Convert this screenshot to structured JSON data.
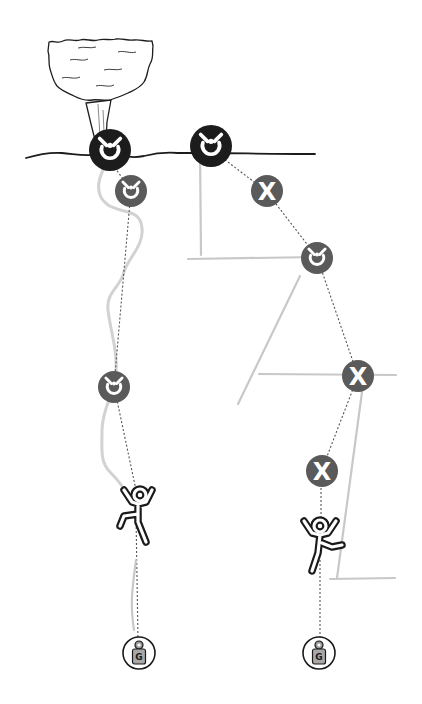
{
  "diagram": {
    "type": "climbing-anchor-fall-comparison",
    "colors": {
      "background": "#ffffff",
      "main_anchor_fill": "#1c1c1c",
      "protection_fill": "#5a5a5a",
      "sling": "#c8c8c8",
      "rope": "#d2d2d2",
      "ground_line": "#1c1c1c",
      "climber_outline": "#1a1a1a"
    },
    "left_system": {
      "anchor": {
        "icon": "ring-bolt-icon",
        "style": "main"
      },
      "protections": [
        {
          "icon": "ring-bolt-icon",
          "label": ""
        },
        {
          "icon": "ring-bolt-icon",
          "label": ""
        }
      ],
      "climber": {
        "icon": "falling-climber-icon"
      },
      "belay_device": {
        "icon": "gri-gri-icon",
        "letter": "G"
      }
    },
    "right_system": {
      "anchor": {
        "icon": "ring-bolt-icon",
        "style": "main"
      },
      "protections": [
        {
          "icon": "failed-protection-icon",
          "glyph": "X"
        },
        {
          "icon": "ring-bolt-icon",
          "label": ""
        },
        {
          "icon": "failed-protection-icon",
          "glyph": "X"
        },
        {
          "icon": "failed-protection-icon",
          "glyph": "X"
        }
      ],
      "climber": {
        "icon": "falling-climber-icon"
      },
      "belay_device": {
        "icon": "gri-gri-icon",
        "letter": "G"
      }
    }
  }
}
